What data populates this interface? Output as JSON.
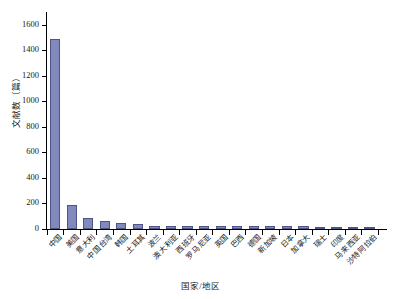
{
  "chart_data": {
    "type": "bar",
    "title": "",
    "xlabel": "国家/地区",
    "ylabel": "文献数（篇）",
    "ylim": [
      0,
      1700
    ],
    "yticks": [
      0,
      200,
      400,
      600,
      800,
      1000,
      1200,
      1400,
      1600
    ],
    "grid": false,
    "legend": null,
    "bar_color": "#8289bd",
    "bar_edge_color": "#4f5484",
    "categories": [
      "中国",
      "美国",
      "意大利",
      "中国台湾",
      "韩国",
      "土耳其",
      "波兰",
      "澳大利亚",
      "西班牙",
      "罗马尼亚",
      "英国",
      "巴西",
      "德国",
      "新加坡",
      "日本",
      "加拿大",
      "瑞士",
      "印度",
      "马来西亚",
      "沙特阿拉伯"
    ],
    "values": [
      1490,
      190,
      85,
      65,
      50,
      40,
      27,
      26,
      25,
      25,
      24,
      24,
      22,
      22,
      20,
      20,
      19,
      18,
      17,
      10
    ]
  }
}
